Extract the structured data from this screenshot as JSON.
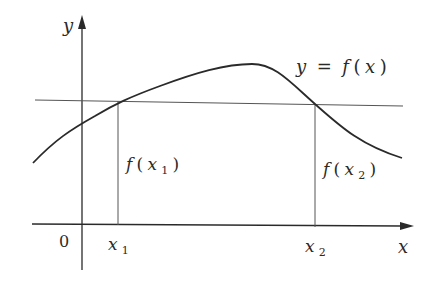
{
  "figure": {
    "axes": {
      "x_label": "x",
      "y_label": "y",
      "origin_label": "0"
    },
    "curve": {
      "label": "y = f(x)",
      "label_y": "y",
      "label_eq": "=",
      "label_f": "f",
      "label_open": "(",
      "label_x": "x",
      "label_close": ")"
    },
    "points": [
      {
        "name": "x1",
        "base": "x",
        "sub": "1",
        "value_label_f": "f",
        "value_label_open": "(",
        "value_label_close": ")"
      },
      {
        "name": "x2",
        "base": "x",
        "sub": "2",
        "value_label_f": "f",
        "value_label_open": "(",
        "value_label_close": ")"
      }
    ],
    "colors": {
      "ink": "#2a2a2a",
      "guide_line": "#555555",
      "background": "#ffffff"
    }
  }
}
